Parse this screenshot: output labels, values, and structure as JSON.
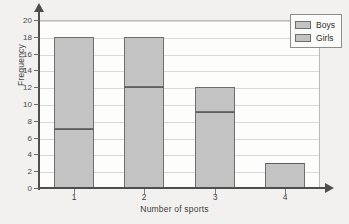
{
  "chart_data": {
    "type": "bar",
    "title": "",
    "subtitle": "",
    "xlabel": "Number of sports",
    "ylabel": "Frequency",
    "categories": [
      "1",
      "2",
      "3",
      "4"
    ],
    "stacked": true,
    "series": [
      {
        "name": "Girls",
        "values": [
          7,
          12,
          9,
          3
        ]
      },
      {
        "name": "Boys",
        "values": [
          11,
          6,
          3,
          0
        ]
      }
    ],
    "totals": [
      18,
      18,
      12,
      3
    ],
    "ylim": [
      0,
      20
    ],
    "ytick_step": 2,
    "yticks": [
      0,
      2,
      4,
      6,
      8,
      10,
      12,
      14,
      16,
      18,
      20
    ],
    "ytick_labels": [
      "0",
      "2",
      "4",
      "6",
      "8",
      "10",
      "12",
      "14",
      "16",
      "18",
      "20"
    ],
    "xtick_labels": [
      "1",
      "2",
      "3",
      "4"
    ],
    "grid": true,
    "grid_axis": "y",
    "legend": [
      "Boys",
      "Girls"
    ],
    "legend_position": "top-right",
    "colors": {
      "bar_fill": "#c3c3c3",
      "bar_edge": "#6e6e6e",
      "divider": "#5d5d5d",
      "gridline": "#d8d8d8",
      "axis": "#4e4e4e",
      "plot_background": "#fdfdfc",
      "page_background": "#f2f1ef",
      "text": "#3d3d3d"
    }
  },
  "legend": {
    "items": [
      {
        "label": "Boys"
      },
      {
        "label": "Girls"
      }
    ]
  },
  "axes": {
    "x_title": "Number of sports",
    "y_title": "Frequency"
  }
}
